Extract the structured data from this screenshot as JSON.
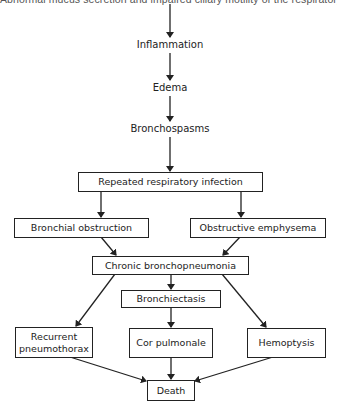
{
  "diagram": {
    "top_clipped_text": "Abnormal mucus secretion and impaired ciliary motility of the respiratory tract",
    "chain_labels": [
      {
        "id": "inflammation",
        "text": "Inflammation"
      },
      {
        "id": "edema",
        "text": "Edema"
      },
      {
        "id": "bronchospasms",
        "text": "Bronchospasms"
      }
    ],
    "boxes": {
      "repeated_infection": "Repeated respiratory infection",
      "bronchial_obstruction": "Bronchial obstruction",
      "obstructive_emphysema": "Obstructive emphysema",
      "chronic_bronchopneumonia": "Chronic bronchopneumonia",
      "bronchiectasis": "Bronchiectasis",
      "recurrent_pneumothorax": "Recurrent pneumothorax",
      "cor_pulmonale": "Cor pulmonale",
      "hemoptysis": "Hemoptysis",
      "death": "Death"
    },
    "edges": [
      [
        "top_clipped_text",
        "inflammation"
      ],
      [
        "inflammation",
        "edema"
      ],
      [
        "edema",
        "bronchospasms"
      ],
      [
        "bronchospasms",
        "repeated_infection"
      ],
      [
        "repeated_infection",
        "bronchial_obstruction"
      ],
      [
        "repeated_infection",
        "obstructive_emphysema"
      ],
      [
        "bronchial_obstruction",
        "chronic_bronchopneumonia"
      ],
      [
        "obstructive_emphysema",
        "chronic_bronchopneumonia"
      ],
      [
        "chronic_bronchopneumonia",
        "recurrent_pneumothorax"
      ],
      [
        "chronic_bronchopneumonia",
        "bronchiectasis"
      ],
      [
        "chronic_bronchopneumonia",
        "hemoptysis"
      ],
      [
        "bronchiectasis",
        "cor_pulmonale"
      ],
      [
        "recurrent_pneumothorax",
        "death"
      ],
      [
        "cor_pulmonale",
        "death"
      ],
      [
        "hemoptysis",
        "death"
      ]
    ],
    "colors": {
      "line": "#222222",
      "background": "#ffffff"
    }
  }
}
